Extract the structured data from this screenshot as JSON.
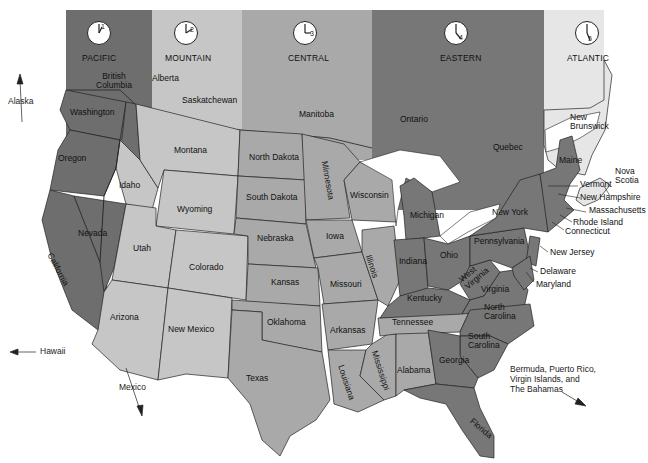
{
  "colors": {
    "pacific": "#6e6e6e",
    "mountain": "#c6c6c6",
    "central": "#a9a9a9",
    "eastern": "#777777",
    "atlantic": "#e6e6e6",
    "water": "#ffffff",
    "border": "#222222"
  },
  "zones": [
    {
      "name": "PACIFIC",
      "clock_hour": "1"
    },
    {
      "name": "MOUNTAIN",
      "clock_hour": "2"
    },
    {
      "name": "CENTRAL",
      "clock_hour": "3"
    },
    {
      "name": "EASTERN",
      "clock_hour": "4"
    },
    {
      "name": "ATLANTIC",
      "clock_hour": "5"
    }
  ],
  "provinces": {
    "british_columbia": "British\nColumbia",
    "alberta": "Alberta",
    "saskatchewan": "Saskatchewan",
    "manitoba": "Manitoba",
    "ontario": "Ontario",
    "quebec": "Quebec",
    "new_brunswick": "New\nBrunswick",
    "nova_scotia": "Nova\nScotia"
  },
  "states": {
    "washington": "Washington",
    "oregon": "Oregon",
    "california": "California",
    "nevada": "Nevada",
    "idaho": "Idaho",
    "montana": "Montana",
    "wyoming": "Wyoming",
    "utah": "Utah",
    "colorado": "Colorado",
    "arizona": "Arizona",
    "new_mexico": "New Mexico",
    "north_dakota": "North Dakota",
    "south_dakota": "South Dakota",
    "nebraska": "Nebraska",
    "kansas": "Kansas",
    "oklahoma": "Oklahoma",
    "texas": "Texas",
    "minnesota": "Minnesota",
    "iowa": "Iowa",
    "missouri": "Missouri",
    "arkansas": "Arkansas",
    "louisiana": "Louisiana",
    "wisconsin": "Wisconsin",
    "illinois": "Illinois",
    "mississippi": "Mississippi",
    "alabama": "Alabama",
    "tennessee": "Tennessee",
    "kentucky": "Kentucky",
    "michigan": "Michigan",
    "indiana": "Indiana",
    "ohio": "Ohio",
    "west_virginia": "West\nVirginia",
    "virginia": "Virginia",
    "north_carolina": "North\nCarolina",
    "south_carolina": "South\nCarolina",
    "georgia": "Georgia",
    "florida": "Florida",
    "pennsylvania": "Pennsylvania",
    "new_york": "New York",
    "maine": "Maine",
    "vermont": "Vermont",
    "new_hampshire": "New Hampshire",
    "massachusetts": "Massachusetts",
    "rhode_island": "Rhode Island",
    "connecticut": "Connecticut",
    "new_jersey": "New Jersey",
    "delaware": "Delaware",
    "maryland": "Maryland"
  },
  "external": {
    "alaska": "Alaska",
    "hawaii": "Hawaii",
    "mexico": "Mexico",
    "caribbean": "Bermuda, Puerto Rico,\nVirgin Islands, and\nThe Bahamas"
  }
}
